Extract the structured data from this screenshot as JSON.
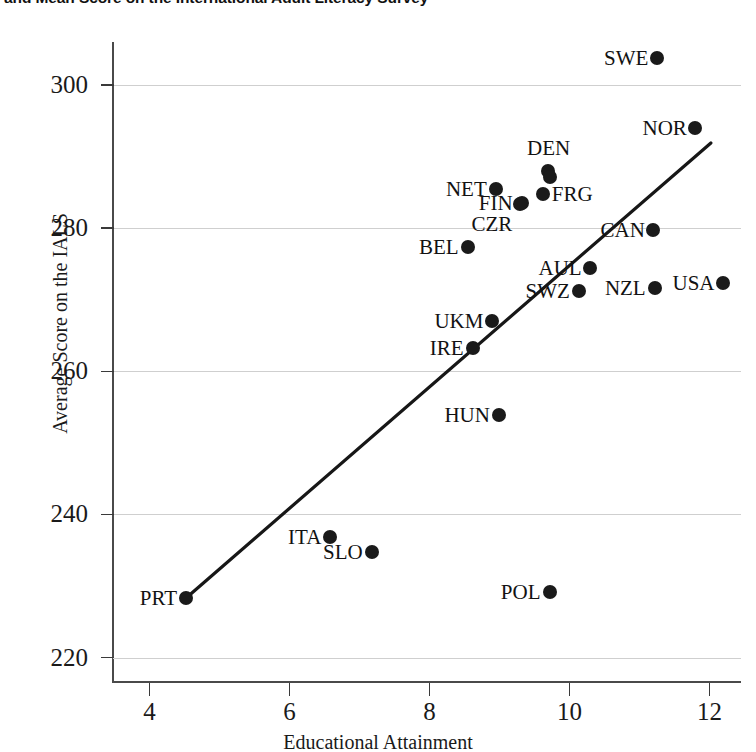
{
  "chart_data": {
    "type": "scatter",
    "title": "and Mean Score on the International Adult Literacy Survey",
    "xlabel": "Educational Attainment",
    "ylabel": "Average Score on the IALS",
    "xlim": [
      3.48,
      12.45
    ],
    "ylim": [
      216.6,
      306.0
    ],
    "xticks": [
      4,
      6,
      8,
      10,
      12
    ],
    "yticks": [
      220,
      240,
      260,
      280,
      300
    ],
    "grid": true,
    "legend": "none",
    "point_label_field": "label",
    "points": [
      {
        "label": "SWE",
        "x": 11.25,
        "y": 303.8,
        "label_pos": "left"
      },
      {
        "label": "NOR",
        "x": 11.8,
        "y": 294.0,
        "label_pos": "left"
      },
      {
        "label": "DEN",
        "x": 9.7,
        "y": 288.0,
        "label_pos": "above"
      },
      {
        "label": "DEN",
        "x": 9.72,
        "y": 287.2,
        "label_pos": "none"
      },
      {
        "label": "FIN",
        "x": 9.32,
        "y": 283.5,
        "label_pos": "left"
      },
      {
        "label": "NET",
        "x": 8.95,
        "y": 285.5,
        "label_pos": "left"
      },
      {
        "label": "FRG",
        "x": 9.62,
        "y": 284.8,
        "label_pos": "right"
      },
      {
        "label": "CZR",
        "x": 9.3,
        "y": 283.4,
        "label_pos": "below-left"
      },
      {
        "label": "CAN",
        "x": 11.2,
        "y": 279.8,
        "label_pos": "left"
      },
      {
        "label": "BEL",
        "x": 8.55,
        "y": 277.3,
        "label_pos": "left"
      },
      {
        "label": "AUL",
        "x": 10.3,
        "y": 274.5,
        "label_pos": "left"
      },
      {
        "label": "SWZ",
        "x": 10.13,
        "y": 271.2,
        "label_pos": "left"
      },
      {
        "label": "NZL",
        "x": 11.22,
        "y": 271.6,
        "label_pos": "left"
      },
      {
        "label": "USA",
        "x": 12.2,
        "y": 272.3,
        "label_pos": "left"
      },
      {
        "label": "UKM",
        "x": 8.9,
        "y": 267.0,
        "label_pos": "left"
      },
      {
        "label": "IRE",
        "x": 8.62,
        "y": 263.2,
        "label_pos": "left"
      },
      {
        "label": "HUN",
        "x": 9.0,
        "y": 253.9,
        "label_pos": "left"
      },
      {
        "label": "ITA",
        "x": 6.58,
        "y": 236.8,
        "label_pos": "left"
      },
      {
        "label": "SLO",
        "x": 7.18,
        "y": 234.8,
        "label_pos": "left"
      },
      {
        "label": "PRT",
        "x": 4.52,
        "y": 228.3,
        "label_pos": "left"
      },
      {
        "label": "POL",
        "x": 9.72,
        "y": 229.2,
        "label_pos": "left"
      }
    ],
    "trendline": {
      "x_start": 4.52,
      "y_start": 228.3,
      "x_end": 12.02,
      "y_end": 291.9
    }
  }
}
